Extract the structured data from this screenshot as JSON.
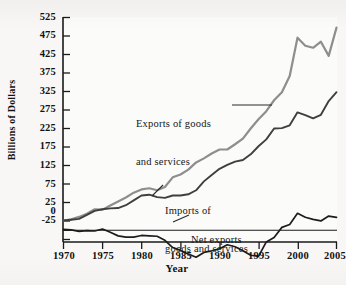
{
  "figure": {
    "background_color": "#f8f7f5",
    "top_cut_text": "",
    "axis_color": "#1a1a1a"
  },
  "chart_data": {
    "type": "line",
    "title": "",
    "xlabel": "Year",
    "ylabel": "Billions of Dollars",
    "xlim": [
      1970,
      2005
    ],
    "ylim": [
      -25,
      525
    ],
    "grid": false,
    "legend_position": "inline-annotations",
    "x_ticks": [
      "1970",
      "1975",
      "1980",
      "1985",
      "1990",
      "1995",
      "2000",
      "2005"
    ],
    "y_ticks": [
      "525",
      "475",
      "425",
      "375",
      "325",
      "275",
      "225",
      "175",
      "125",
      "75",
      "25",
      "0",
      "-25"
    ],
    "x": [
      1970,
      1971,
      1972,
      1973,
      1974,
      1975,
      1976,
      1977,
      1978,
      1979,
      1980,
      1981,
      1982,
      1983,
      1984,
      1985,
      1986,
      1987,
      1988,
      1989,
      1990,
      1991,
      1992,
      1993,
      1994,
      1995,
      1996,
      1997,
      1998,
      1999,
      2000,
      2001,
      2002,
      2003,
      2004,
      2005
    ],
    "series": [
      {
        "name": "Exports of goods and services",
        "color": "#3f3f3f",
        "values": [
          22,
          24,
          26,
          36,
          46,
          50,
          52,
          53,
          60,
          72,
          84,
          86,
          80,
          78,
          84,
          84,
          87,
          97,
          119,
          135,
          150,
          160,
          168,
          172,
          186,
          206,
          223,
          250,
          251,
          258,
          290,
          283,
          275,
          284,
          318,
          340
        ]
      },
      {
        "name": "Imports of goods and services",
        "color": "#8e8e8e",
        "values": [
          22,
          25,
          31,
          39,
          50,
          49,
          59,
          69,
          79,
          91,
          99,
          102,
          97,
          105,
          129,
          136,
          148,
          166,
          176,
          188,
          198,
          198,
          211,
          225,
          250,
          273,
          293,
          320,
          340,
          380,
          475,
          455,
          450,
          465,
          430,
          500
        ]
      },
      {
        "name": "Net exports",
        "color": "#1c1c1c",
        "values": [
          0,
          -1,
          -5,
          -3,
          -4,
          1,
          -7,
          -16,
          -19,
          -19,
          -15,
          -16,
          -17,
          -27,
          -45,
          -52,
          -61,
          -69,
          -57,
          -53,
          -48,
          -38,
          -43,
          -53,
          -64,
          -67,
          -31,
          -20,
          5,
          12,
          40,
          30,
          25,
          21,
          33,
          30
        ]
      }
    ],
    "annotations": [
      {
        "name": "exports-label",
        "text_line1": "Exports of goods",
        "text_line2": "and services"
      },
      {
        "name": "imports-label",
        "text_line1": "Imports of",
        "text_line2": "goods and services"
      },
      {
        "name": "net-exports-label",
        "text_line1": "Net exports",
        "text_line2": ""
      }
    ]
  }
}
